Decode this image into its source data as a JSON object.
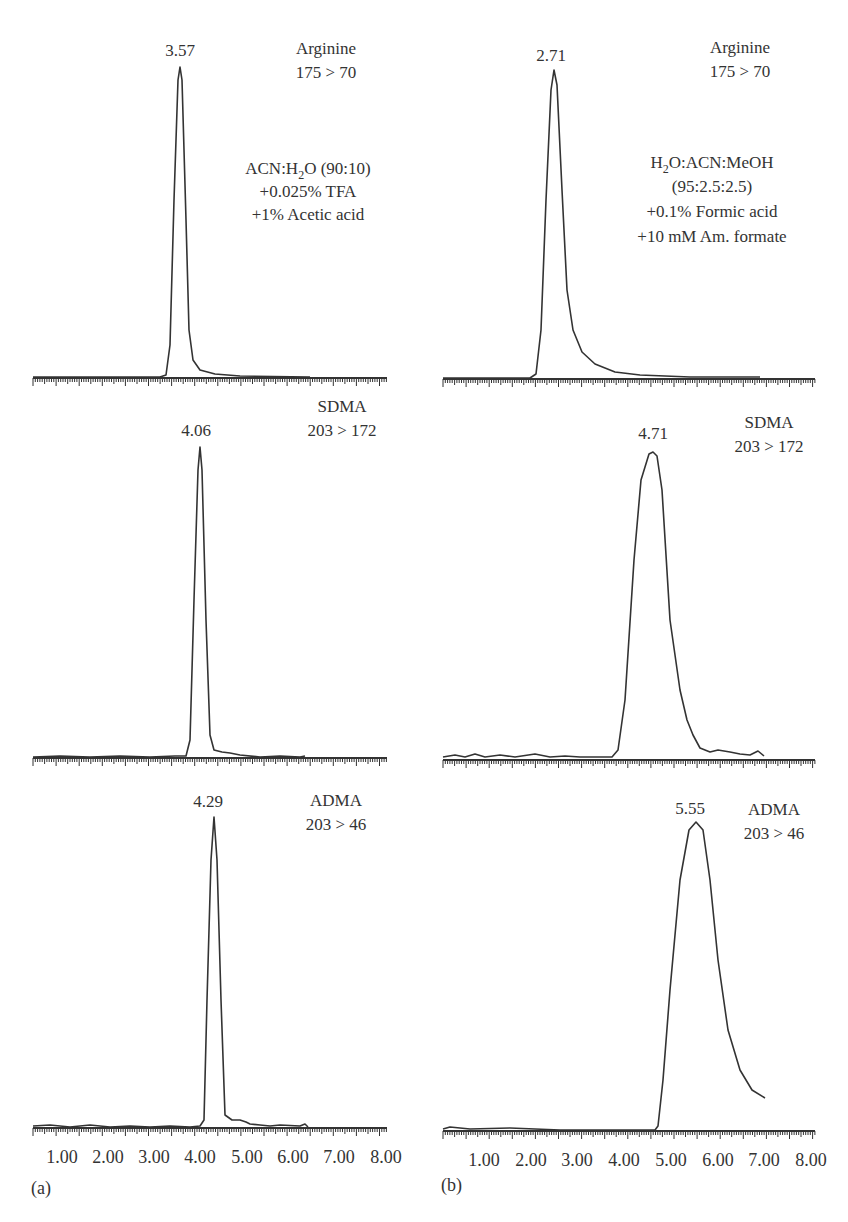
{
  "chart_data": [
    {
      "type": "line",
      "panel": "(a)",
      "title": "",
      "xlabel": "",
      "ylabel": "",
      "xlim": [
        0.35,
        8.0
      ],
      "x_tick_labels": [
        "1.00",
        "2.00",
        "3.00",
        "4.00",
        "5.00",
        "6.00",
        "7.00",
        "8.00"
      ],
      "mobile_phase": [
        "ACN:H2O (90:10)",
        "+0.025% TFA",
        "+1% Acetic acid"
      ],
      "series": [
        {
          "name": "Arginine",
          "transition": "175 > 70",
          "peak_rt": 3.57,
          "peak_label": "3.57",
          "trace_end": 6.3
        },
        {
          "name": "SDMA",
          "transition": "203 > 172",
          "peak_rt": 4.06,
          "peak_label": "4.06",
          "trace_end": 6.3
        },
        {
          "name": "ADMA",
          "transition": "203 > 46",
          "peak_rt": 4.29,
          "peak_label": "4.29",
          "trace_end": 6.3
        }
      ]
    },
    {
      "type": "line",
      "panel": "(b)",
      "title": "",
      "xlabel": "",
      "ylabel": "",
      "xlim": [
        0.0,
        8.0
      ],
      "x_tick_labels": [
        "1.00",
        "2.00",
        "3.00",
        "4.00",
        "5.00",
        "6.00",
        "7.00",
        "8.00"
      ],
      "mobile_phase": [
        "H2O:ACN:MeOH",
        "(95:2.5:2.5)",
        "+0.1% Formic acid",
        "+10 mM Am. formate"
      ],
      "series": [
        {
          "name": "Arginine",
          "transition": "175 > 70",
          "peak_rt": 2.71,
          "peak_label": "2.71",
          "trace_end": 7.0
        },
        {
          "name": "SDMA",
          "transition": "203 > 172",
          "peak_rt": 4.71,
          "peak_label": "4.71",
          "trace_end": 7.0
        },
        {
          "name": "ADMA",
          "transition": "203 > 46",
          "peak_rt": 5.55,
          "peak_label": "5.55",
          "trace_end": 7.0
        }
      ]
    }
  ],
  "panels": {
    "a": {
      "label": "(a)",
      "ticks": [
        "1.00",
        "2.00",
        "3.00",
        "4.00",
        "5.00",
        "6.00",
        "7.00",
        "8.00"
      ],
      "arg": {
        "rt": "3.57",
        "name": "Arginine",
        "mrm": "175 > 70"
      },
      "sdma": {
        "rt": "4.06",
        "name": "SDMA",
        "mrm": "203 > 172"
      },
      "adma": {
        "rt": "4.29",
        "name": "ADMA",
        "mrm": "203 > 46"
      },
      "phase": {
        "l1_pre": "ACN:H",
        "l1_sub": "2",
        "l1_post": "O (90:10)",
        "l2": "+0.025% TFA",
        "l3": "+1% Acetic acid"
      }
    },
    "b": {
      "label": "(b)",
      "ticks": [
        "1.00",
        "2.00",
        "3.00",
        "4.00",
        "5.00",
        "6.00",
        "7.00",
        "8.00"
      ],
      "arg": {
        "rt": "2.71",
        "name": "Arginine",
        "mrm": "175 > 70"
      },
      "sdma": {
        "rt": "4.71",
        "name": "SDMA",
        "mrm": "203 > 172"
      },
      "adma": {
        "rt": "5.55",
        "name": "ADMA",
        "mrm": "203 > 46"
      },
      "phase": {
        "l1_pre": "H",
        "l1_sub": "2",
        "l1_post": "O:ACN:MeOH",
        "l2": "(95:2.5:2.5)",
        "l3": "+0.1% Formic acid",
        "l4": "+10 mM Am. formate"
      }
    }
  }
}
